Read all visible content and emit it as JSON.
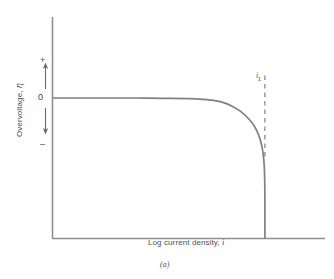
{
  "figure": {
    "caption": "(a)",
    "background_color": "#ffffff",
    "line_color": "#808080",
    "text_color": "#4a4a4a"
  },
  "axes": {
    "y_title_prefix": "Overvoltage, ",
    "y_title_symbol": "η",
    "y_title_full": "Overvoltage, η",
    "x_title_prefix": "Log current density, ",
    "x_title_symbol": "i",
    "x_title_full": "Log current density, i",
    "zero_tick_label": "0",
    "positive_sign": "+",
    "negative_sign": "–"
  },
  "annotations": {
    "limiting_current_symbol": "i",
    "limiting_current_subscript": "L",
    "limiting_current_full": "i_L"
  },
  "chart_data": {
    "type": "line",
    "title": "",
    "subtitle": "",
    "xlabel": "Log current density, i",
    "ylabel": "Overvoltage, η",
    "grid": false,
    "legend": "none",
    "xlim": [
      0,
      10
    ],
    "ylim": [
      -1,
      1
    ],
    "x_tick_labels": [],
    "y_tick_labels": [
      "0"
    ],
    "y_axis_direction_labels": {
      "top": "+",
      "bottom": "–"
    },
    "series": [
      {
        "name": "concentration polarization curve",
        "style": "solid",
        "color": "#808080",
        "points": [
          {
            "x": 0.0,
            "y": 0.0
          },
          {
            "x": 1.0,
            "y": 0.0
          },
          {
            "x": 2.0,
            "y": 0.0
          },
          {
            "x": 3.0,
            "y": 0.0
          },
          {
            "x": 4.0,
            "y": -0.002
          },
          {
            "x": 5.0,
            "y": -0.005
          },
          {
            "x": 5.5,
            "y": -0.01
          },
          {
            "x": 6.0,
            "y": -0.02
          },
          {
            "x": 6.3,
            "y": -0.035
          },
          {
            "x": 6.6,
            "y": -0.06
          },
          {
            "x": 6.9,
            "y": -0.095
          },
          {
            "x": 7.2,
            "y": -0.15
          },
          {
            "x": 7.4,
            "y": -0.2
          },
          {
            "x": 7.55,
            "y": -0.26
          },
          {
            "x": 7.65,
            "y": -0.32
          },
          {
            "x": 7.72,
            "y": -0.39
          },
          {
            "x": 7.76,
            "y": -0.47
          },
          {
            "x": 7.78,
            "y": -0.56
          },
          {
            "x": 7.79,
            "y": -0.7
          },
          {
            "x": 7.79,
            "y": -1.0
          }
        ]
      }
    ],
    "annotations": [
      {
        "label": "i_L",
        "type": "vertical-dashed-line",
        "x": 7.79,
        "y_from": 0.16,
        "y_to": -0.43,
        "color": "#8a8a8a",
        "description": "limiting current density asymptote"
      }
    ]
  }
}
